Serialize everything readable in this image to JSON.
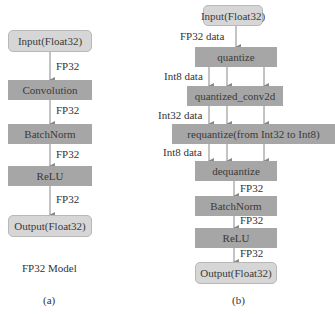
{
  "diagram_a": {
    "nodes": [
      {
        "id": "input",
        "label": "Input(Float32)",
        "kind": "io"
      },
      {
        "id": "conv",
        "label": "Convolution",
        "kind": "op"
      },
      {
        "id": "bn",
        "label": "BatchNorm",
        "kind": "op"
      },
      {
        "id": "relu",
        "label": "ReLU",
        "kind": "op"
      },
      {
        "id": "output",
        "label": "Output(Float32)",
        "kind": "io"
      }
    ],
    "edges": [
      {
        "from": "input",
        "to": "conv",
        "label": "FP32"
      },
      {
        "from": "conv",
        "to": "bn",
        "label": "FP32"
      },
      {
        "from": "bn",
        "to": "relu",
        "label": "FP32"
      },
      {
        "from": "relu",
        "to": "output",
        "label": "FP32"
      }
    ],
    "title": "FP32 Model",
    "caption": "(a)"
  },
  "diagram_b": {
    "nodes": [
      {
        "id": "input",
        "label": "Input(Float32)",
        "kind": "io"
      },
      {
        "id": "quantize",
        "label": "quantize",
        "kind": "op"
      },
      {
        "id": "qconv",
        "label": "quantized_conv2d",
        "kind": "op"
      },
      {
        "id": "requant",
        "label": "requantize(from Int32 to Int8)",
        "kind": "op"
      },
      {
        "id": "dequant",
        "label": "dequantize",
        "kind": "op"
      },
      {
        "id": "bn",
        "label": "BatchNorm",
        "kind": "op"
      },
      {
        "id": "relu",
        "label": "ReLU",
        "kind": "op"
      },
      {
        "id": "output",
        "label": "Output(Float32)",
        "kind": "io"
      }
    ],
    "edges": [
      {
        "from": "input",
        "to": "quantize",
        "label": "FP32 data"
      },
      {
        "from": "quantize",
        "to": "qconv",
        "label": "Int8 data"
      },
      {
        "from": "qconv",
        "to": "requant",
        "label": "Int32 data"
      },
      {
        "from": "requant",
        "to": "dequant",
        "label": "Int8 data"
      },
      {
        "from": "dequant",
        "to": "bn",
        "label": "FP32"
      },
      {
        "from": "bn",
        "to": "relu",
        "label": "FP32"
      },
      {
        "from": "relu",
        "to": "output",
        "label": "FP32"
      }
    ],
    "caption": "(b)"
  },
  "colors": {
    "op_fill": "#a6a6a6",
    "io_fill": "#d6d6d6",
    "arrow": "#888888",
    "text": "#333333"
  }
}
